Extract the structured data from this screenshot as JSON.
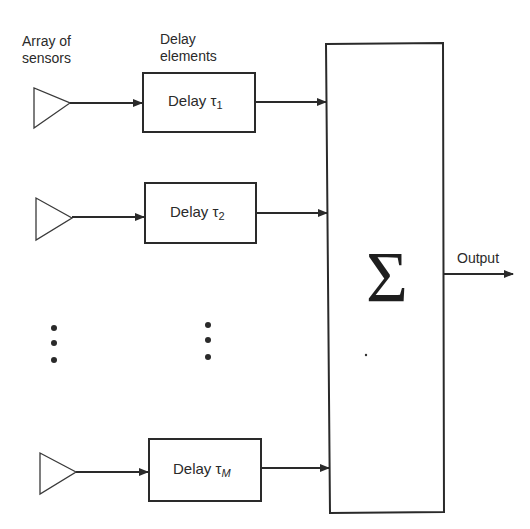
{
  "diagram": {
    "type": "delay-and-sum beamformer block diagram",
    "headers": {
      "sensors_line1": "Array of",
      "sensors_line2": "sensors",
      "delays_line1": "Delay",
      "delays_line2": "elements"
    },
    "rows": [
      {
        "delay_label": "Delay τ",
        "subscript": "1"
      },
      {
        "delay_label": "Delay τ",
        "subscript": "2"
      },
      {
        "delay_label": "Delay τ",
        "subscript": "M"
      }
    ],
    "ellipsis": "⋮",
    "summer": {
      "symbol": "Σ"
    },
    "output_label": "Output",
    "colors": {
      "stroke": "#2a2a2a",
      "background": "#ffffff"
    }
  }
}
